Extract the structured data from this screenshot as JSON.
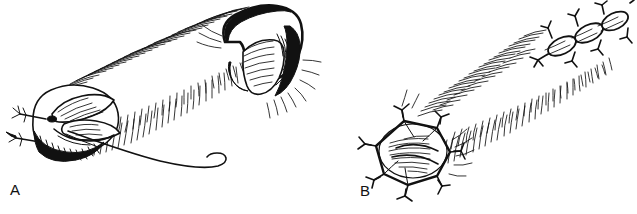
{
  "figure": {
    "type": "scientific-line-drawing",
    "caption_present": false,
    "background_color": "#ffffff",
    "ink_color": "#111111",
    "width": 637,
    "height": 214,
    "style": "pen-and-ink hatched biological illustration, two specimens"
  },
  "panels": [
    {
      "id": "A",
      "label": "A",
      "label_position": {
        "x": 10,
        "y": 182
      },
      "description": "Elongate organism oriented lower-left to upper-right; bulbous anterior end at lower left with overlapping lobed plates and dense oblique hatching, two small barbed appendages projecting from the left margin, a long tapering flagellum sweeping right and terminating in a small recurved hook; body flanked by dense rows of short cilia-like strokes; posterior swollen cap at upper right drawn with heavy black outline and radial hatching.",
      "features": [
        "anterior-bulb",
        "lobed-plates",
        "barbed-appendages",
        "flagellum",
        "terminal-hook",
        "ciliary-fringe",
        "posterior-cap"
      ]
    },
    {
      "id": "B",
      "label": "B",
      "label_position": {
        "x": 360,
        "y": 183
      },
      "description": "Elongate organism oriented lower-left to upper-right; anterior end at lower left formed by a heptagonal ring of stout connected spines each splitting into forked barbs, enclosing a finely hatched oval disc; cylindrical trunk flanked by two dense bands of short curved ciliary strokes; posterior end at upper right bearing a short chain of three elongate segments each tipped with forked hooks.",
      "features": [
        "polygonal-spine-ring",
        "forked-barbs",
        "hatched-disc",
        "ciliary-bands",
        "segmented-posterior-chain",
        "terminal-hooks"
      ]
    }
  ],
  "labels": {
    "a": "A",
    "b": "B"
  }
}
